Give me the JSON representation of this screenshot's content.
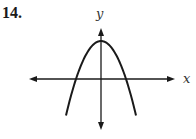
{
  "problem": {
    "number": "14."
  },
  "chart_data": {
    "type": "line",
    "title": "",
    "xlabel": "x",
    "ylabel": "y",
    "ticks": false,
    "grid": false,
    "series": [
      {
        "name": "parabola",
        "shape": "y = k - a*x^2 (a > 0, k > 0)",
        "vertex": [
          0,
          1
        ],
        "x_intercepts": [
          -1,
          1
        ],
        "x": [
          -1.4,
          -1.2,
          -1,
          -0.8,
          -0.6,
          -0.4,
          -0.2,
          0,
          0.2,
          0.4,
          0.6,
          0.8,
          1,
          1.2,
          1.4
        ],
        "y": [
          -0.96,
          -0.44,
          0,
          0.36,
          0.64,
          0.84,
          0.96,
          1,
          0.96,
          0.84,
          0.64,
          0.36,
          0,
          -0.44,
          -0.96
        ]
      }
    ],
    "xlim": [
      -3,
      3
    ],
    "ylim": [
      -1.3,
      1.4
    ]
  },
  "colors": {
    "stroke": "#1a1a1a"
  }
}
